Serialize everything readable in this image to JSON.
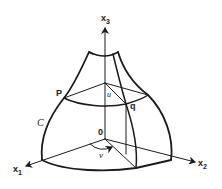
{
  "figure": {
    "axes": {
      "x1": {
        "label": "x",
        "subscript": "1"
      },
      "x2": {
        "label": "x",
        "subscript": "2"
      },
      "x3": {
        "label": "x",
        "subscript": "3"
      }
    },
    "points": {
      "origin": "0",
      "p": "P",
      "q": "q"
    },
    "curve_label": "C",
    "parameters": {
      "u": "u",
      "v": "v"
    },
    "colors": {
      "stroke": "#1a1a1a",
      "background": "#ffffff"
    }
  }
}
